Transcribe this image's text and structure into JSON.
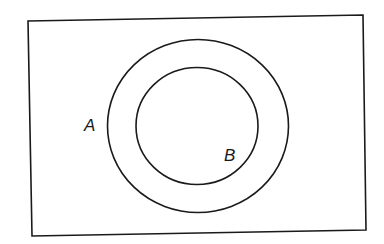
{
  "diagram": {
    "type": "venn",
    "universe": {
      "label": ""
    },
    "sets": [
      {
        "id": "A",
        "label": "A",
        "contains": [
          "B"
        ]
      },
      {
        "id": "B",
        "label": "B",
        "subset_of": "A"
      }
    ],
    "relationship": "B ⊂ A",
    "colors": {
      "stroke": "#1a1a1a",
      "background": "#ffffff"
    }
  }
}
